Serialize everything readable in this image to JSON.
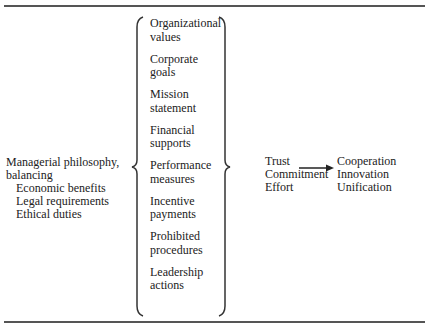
{
  "diagram": {
    "inputs": {
      "heading_line1": "Managerial philosophy,",
      "heading_line2": "balancing",
      "items": [
        "Economic benefits",
        "Legal requirements",
        "Ethical duties"
      ]
    },
    "mechanisms": [
      {
        "line1": "Organizational",
        "line2": "values"
      },
      {
        "line1": "Corporate",
        "line2": "goals"
      },
      {
        "line1": "Mission",
        "line2": "statement"
      },
      {
        "line1": "Financial",
        "line2": "supports"
      },
      {
        "line1": "Performance",
        "line2": "measures"
      },
      {
        "line1": "Incentive",
        "line2": "payments"
      },
      {
        "line1": "Prohibited",
        "line2": "procedures"
      },
      {
        "line1": "Leadership",
        "line2": "actions"
      }
    ],
    "intermediate": [
      "Trust",
      "Commitment",
      "Effort"
    ],
    "outcomes": [
      "Cooperation",
      "Innovation",
      "Unification"
    ],
    "colors": {
      "ink": "#222222",
      "rule": "#555555"
    }
  }
}
